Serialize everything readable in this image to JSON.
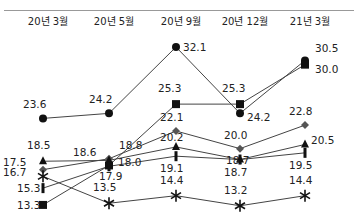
{
  "chart_data": {
    "type": "line",
    "title": "",
    "xlabel": "",
    "ylabel": "",
    "grid": false,
    "legend": "none",
    "categories": [
      "20년 3월",
      "20년 5월",
      "20년 9월",
      "20년 12월",
      "21년 3월"
    ],
    "series": [
      {
        "name": "circle",
        "marker": "circle",
        "values": [
          23.6,
          24.2,
          32.1,
          24.2,
          30.5
        ]
      },
      {
        "name": "square",
        "marker": "square",
        "values": [
          13.3,
          18.0,
          25.3,
          25.3,
          30.0
        ]
      },
      {
        "name": "diamond",
        "marker": "diamond",
        "values": [
          17.5,
          18.8,
          22.1,
          20.0,
          22.8
        ]
      },
      {
        "name": "triangle",
        "marker": "triangle",
        "values": [
          18.5,
          18.6,
          20.2,
          18.7,
          20.5
        ]
      },
      {
        "name": "bar",
        "marker": "bar",
        "values": [
          15.3,
          17.9,
          19.1,
          18.7,
          19.5
        ]
      },
      {
        "name": "asterisk",
        "marker": "asterisk",
        "values": [
          16.7,
          13.5,
          14.4,
          13.2,
          14.4
        ]
      }
    ]
  }
}
